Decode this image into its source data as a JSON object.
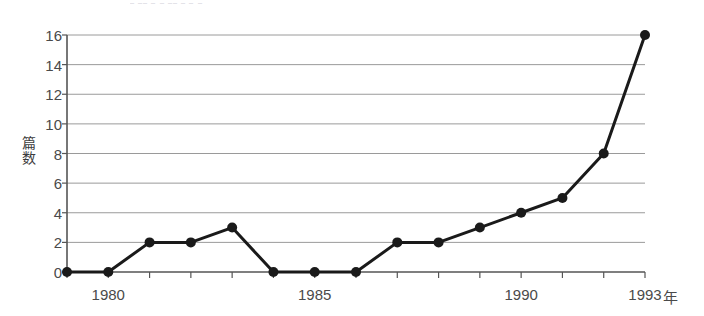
{
  "figure": {
    "title_remnant": "⎯ ⎯⎯ ⎯ ⎯  ⎯⎯ ⎯   ⎯ ⎯",
    "axis_color": "#555555",
    "gridline_color": "#9a9a9a",
    "series_color": "#1a1a1a",
    "text_color": "#4a4a4a",
    "background": "#ffffff"
  },
  "chart_data": {
    "type": "line",
    "title": "",
    "xlabel": "年",
    "ylabel": "篇数",
    "x": [
      1979,
      1980,
      1981,
      1982,
      1983,
      1984,
      1985,
      1986,
      1987,
      1988,
      1989,
      1990,
      1991,
      1992,
      1993
    ],
    "values": [
      0,
      0,
      2,
      2,
      3,
      0,
      0,
      0,
      2,
      2,
      3,
      4,
      5,
      8,
      16
    ],
    "xlim": [
      1979,
      1993
    ],
    "ylim": [
      0,
      16
    ],
    "yticks": [
      0,
      2,
      4,
      6,
      8,
      10,
      12,
      14,
      16
    ],
    "ytick_labels": [
      "0",
      "2",
      "4",
      "6",
      "8",
      "10",
      "12",
      "14",
      "16"
    ],
    "xticks": [
      1980,
      1985,
      1990,
      1993
    ],
    "xtick_labels": [
      "1980",
      "1985",
      "1990",
      "1993"
    ],
    "xminor_ticks": [
      1979,
      1980,
      1981,
      1982,
      1983,
      1984,
      1985,
      1986,
      1987,
      1988,
      1989,
      1990,
      1991,
      1992,
      1993
    ],
    "grid": true,
    "grid_axis": "y",
    "legend": null,
    "marker": "circle",
    "marker_size": 5
  }
}
